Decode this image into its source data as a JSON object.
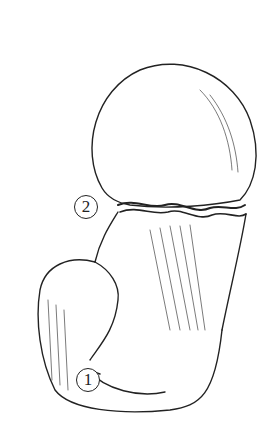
{
  "figure": {
    "labels": [
      {
        "id": "1",
        "text": "1"
      },
      {
        "id": "2",
        "text": "2"
      }
    ],
    "colors": {
      "ink": "#222222",
      "background": "#ffffff"
    }
  }
}
